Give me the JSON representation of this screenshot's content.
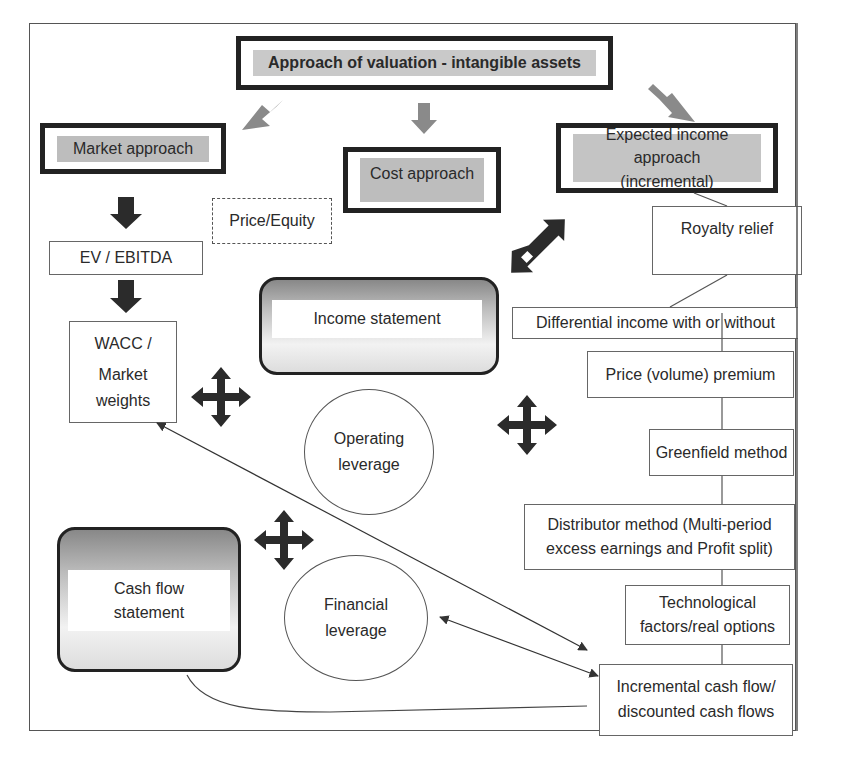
{
  "diagram": {
    "title": "Approach of valuation - intangible assets",
    "approaches": {
      "market": "Market approach",
      "cost": "Cost approach",
      "income": "Expected income approach (incremental)",
      "income_line1": "Expected income approach",
      "income_line2": "(incremental)"
    },
    "market_multiples": {
      "price_equity": "Price/Equity",
      "ev_ebitda": "EV / EBITDA",
      "wacc_line1": "WACC /",
      "wacc_line2": "Market",
      "wacc_line3": "weights"
    },
    "statements": {
      "income_statement": "Income statement",
      "cash_flow_line1": "Cash flow",
      "cash_flow_line2": "statement"
    },
    "leverage": {
      "operating_line1": "Operating",
      "operating_line2": "leverage",
      "financial_line1": "Financial",
      "financial_line2": "leverage"
    },
    "income_methods": [
      {
        "id": "royalty",
        "label": "Royalty relief"
      },
      {
        "id": "differential",
        "label": "Differential income with or without"
      },
      {
        "id": "price_premium",
        "label": "Price (volume) premium"
      },
      {
        "id": "greenfield",
        "label": "Greenfield method"
      },
      {
        "id": "distributor",
        "line1": "Distributor method (Multi-period",
        "line2": "excess earnings and Profit split)"
      },
      {
        "id": "technological",
        "line1": "Technological",
        "line2": "factors/real options"
      },
      {
        "id": "incremental_cf",
        "line1": "Incremental cash flow/",
        "line2": "discounted cash flows"
      }
    ],
    "colors": {
      "thick_border": "#222222",
      "label_fill": "#c9c9c9",
      "grey_arrow": "#888888",
      "dark_arrow": "#2b2b2b",
      "thin_border": "#666666"
    }
  }
}
